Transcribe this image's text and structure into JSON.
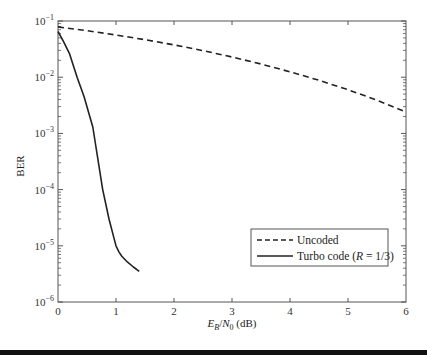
{
  "chart_data": {
    "type": "line",
    "title": "",
    "xlabel": "E_B/N_0 (dB)",
    "xlabel_parts": {
      "E": "E",
      "Esub": "B",
      "slash": "/",
      "N": "N",
      "Nsub": "0",
      "unit": " (dB)"
    },
    "ylabel": "BER",
    "xlim": [
      0,
      6
    ],
    "ylim": [
      1e-06,
      0.1
    ],
    "yscale": "log",
    "grid": false,
    "legend_position": "lower right",
    "x_ticks": [
      "0",
      "1",
      "2",
      "3",
      "4",
      "5",
      "6"
    ],
    "y_ticks": [
      {
        "base": "10",
        "exp": "−1",
        "value": 0.1
      },
      {
        "base": "10",
        "exp": "−2",
        "value": 0.01
      },
      {
        "base": "10",
        "exp": "−3",
        "value": 0.001
      },
      {
        "base": "10",
        "exp": "−4",
        "value": 0.0001
      },
      {
        "base": "10",
        "exp": "−5",
        "value": 1e-05
      },
      {
        "base": "10",
        "exp": "−6",
        "value": 1e-06
      }
    ],
    "series": [
      {
        "name": "Uncoded",
        "style": "dashed",
        "x": [
          0,
          0.5,
          1,
          1.5,
          2,
          2.5,
          3,
          3.5,
          4,
          4.5,
          5,
          5.5,
          6
        ],
        "y": [
          0.0786,
          0.0671,
          0.0563,
          0.0464,
          0.0375,
          0.0297,
          0.0229,
          0.0172,
          0.0125,
          0.0088,
          0.006,
          0.0039,
          0.0024
        ]
      },
      {
        "name": "Turbo code (R = 1/3)",
        "name_parts": {
          "prefix": "Turbo code (",
          "R": "R",
          "suffix": " = 1/3)"
        },
        "style": "solid",
        "x": [
          0,
          0.1,
          0.2,
          0.33,
          0.45,
          0.6,
          0.77,
          0.88,
          0.97,
          1.0,
          1.05,
          1.1,
          1.2,
          1.3,
          1.4
        ],
        "y": [
          0.065,
          0.042,
          0.026,
          0.01,
          0.0045,
          0.0013,
          0.0001,
          3e-05,
          1.3e-05,
          1e-05,
          7.8e-06,
          6.5e-06,
          5.1e-06,
          4.2e-06,
          3.5e-06
        ]
      }
    ]
  },
  "legend": {
    "items": [
      {
        "label": "Uncoded"
      },
      {
        "label_prefix": "Turbo code (",
        "label_italic": "R",
        "label_suffix": " = 1/3)"
      }
    ]
  },
  "colors": {
    "line": "#222222",
    "axis": "#555555",
    "bottom_bar": "#111111"
  }
}
